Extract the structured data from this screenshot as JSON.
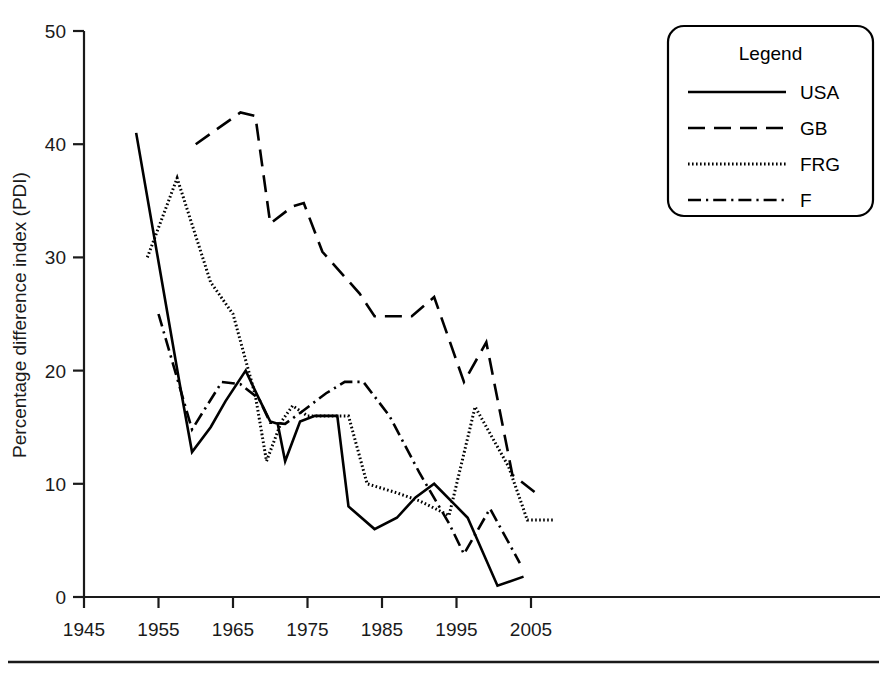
{
  "chart_data": {
    "type": "line",
    "title": "",
    "xlabel": "",
    "ylabel": "Percentage difference index (PDI)",
    "xlim": [
      1945,
      2009
    ],
    "ylim": [
      0,
      50
    ],
    "grid": false,
    "legend_position": "top-right",
    "legend_title": "Legend",
    "xticks": [
      1945,
      1955,
      1965,
      1975,
      1985,
      1995,
      2005
    ],
    "xtick_labels": [
      "1945",
      "1955",
      "1965",
      "1975",
      "1985",
      "1995",
      "2005"
    ],
    "yticks": [
      0,
      10,
      20,
      30,
      40,
      50
    ],
    "ytick_labels": [
      "0",
      "10",
      "20",
      "30",
      "40",
      "50"
    ],
    "series": [
      {
        "name": "USA",
        "style": "solid",
        "color": "#000000",
        "points": [
          [
            1952.0,
            41.0
          ],
          [
            1957.8,
            19.0
          ],
          [
            1959.5,
            12.8
          ],
          [
            1962.0,
            15.0
          ],
          [
            1964.0,
            17.3
          ],
          [
            1966.7,
            20.0
          ],
          [
            1968.5,
            17.5
          ],
          [
            1970.0,
            15.5
          ],
          [
            1971.0,
            15.3
          ],
          [
            1972.0,
            12.0
          ],
          [
            1974.0,
            15.5
          ],
          [
            1976.0,
            16.0
          ],
          [
            1978.0,
            16.0
          ],
          [
            1979.0,
            16.0
          ],
          [
            1980.5,
            8.0
          ],
          [
            1984.0,
            6.0
          ],
          [
            1987.0,
            7.0
          ],
          [
            1989.5,
            8.8
          ],
          [
            1992.0,
            10.0
          ],
          [
            1995.0,
            8.0
          ],
          [
            1996.5,
            7.0
          ],
          [
            2000.5,
            1.0
          ],
          [
            2004.0,
            1.8
          ]
        ]
      },
      {
        "name": "GB",
        "style": "dashed",
        "color": "#000000",
        "points": [
          [
            1960.0,
            40.0
          ],
          [
            1966.0,
            42.8
          ],
          [
            1968.0,
            42.5
          ],
          [
            1970.0,
            33.0
          ],
          [
            1973.0,
            34.5
          ],
          [
            1974.5,
            34.8
          ],
          [
            1977.0,
            30.5
          ],
          [
            1982.0,
            26.8
          ],
          [
            1984.0,
            24.8
          ],
          [
            1989.0,
            24.8
          ],
          [
            1992.0,
            26.5
          ],
          [
            1996.0,
            19.0
          ],
          [
            1999.0,
            22.5
          ],
          [
            2002.5,
            10.8
          ],
          [
            2006.0,
            9.0
          ]
        ]
      },
      {
        "name": "FRG",
        "style": "dotted",
        "color": "#000000",
        "points": [
          [
            1953.5,
            30.0
          ],
          [
            1957.5,
            37.0
          ],
          [
            1962.0,
            27.8
          ],
          [
            1965.0,
            25.0
          ],
          [
            1968.0,
            17.8
          ],
          [
            1969.5,
            12.0
          ],
          [
            1971.5,
            15.5
          ],
          [
            1973.0,
            16.9
          ],
          [
            1975.0,
            16.0
          ],
          [
            1978.0,
            16.0
          ],
          [
            1980.5,
            16.0
          ],
          [
            1983.0,
            10.0
          ],
          [
            1987.0,
            9.2
          ],
          [
            1990.0,
            8.5
          ],
          [
            1994.0,
            7.2
          ],
          [
            1997.5,
            16.8
          ],
          [
            2002.0,
            11.5
          ],
          [
            2004.5,
            6.8
          ],
          [
            2008.0,
            6.8
          ]
        ]
      },
      {
        "name": "F",
        "style": "dashdot",
        "color": "#000000",
        "points": [
          [
            1955.0,
            25.0
          ],
          [
            1959.5,
            14.8
          ],
          [
            1963.5,
            19.0
          ],
          [
            1966.0,
            18.8
          ],
          [
            1968.5,
            17.5
          ],
          [
            1970.0,
            15.4
          ],
          [
            1972.0,
            15.3
          ],
          [
            1974.5,
            16.5
          ],
          [
            1977.5,
            18.0
          ],
          [
            1980.0,
            19.0
          ],
          [
            1982.5,
            19.0
          ],
          [
            1986.0,
            16.0
          ],
          [
            1990.0,
            11.0
          ],
          [
            1994.0,
            6.5
          ],
          [
            1996.0,
            3.8
          ],
          [
            1999.5,
            7.8
          ],
          [
            2003.5,
            3.0
          ]
        ]
      }
    ]
  },
  "legend": {
    "title": "Legend",
    "entries": [
      {
        "label": "USA",
        "style": "solid"
      },
      {
        "label": "GB",
        "style": "dashed"
      },
      {
        "label": "FRG",
        "style": "dotted"
      },
      {
        "label": "F",
        "style": "dashdot"
      }
    ]
  },
  "axes": {
    "y_axis_title": "Percentage difference index (PDI)"
  }
}
